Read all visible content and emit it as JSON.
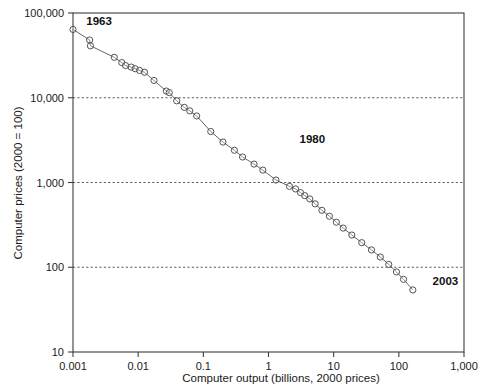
{
  "chart_data": {
    "type": "scatter",
    "title": "",
    "xlabel": "Computer output (billions, 2000 prices)",
    "ylabel": "Computer prices (2000 = 100)",
    "xscale": "log",
    "yscale": "log",
    "xlim": [
      0.001,
      1000
    ],
    "ylim": [
      10,
      100000
    ],
    "grid": "horizontal dashed gridlines at y = 10,000 / 1,000 / 100",
    "legend": "none",
    "marker": "open circle",
    "line": "solid thin connecting line",
    "xticks": [
      0.001,
      0.01,
      0.1,
      1,
      10,
      100,
      1000
    ],
    "xtick_labels": [
      "0.001",
      "0.01",
      "0.1",
      "1",
      "10",
      "100",
      "1,000"
    ],
    "yticks": [
      10,
      100,
      1000,
      10000,
      100000
    ],
    "ytick_labels": [
      "10",
      "100",
      "1,000",
      "10,000",
      "100,000"
    ],
    "gridline_values": [
      10000,
      1000,
      100
    ],
    "annotations": [
      {
        "text": "1963",
        "x": 0.0016,
        "y": 72000,
        "anchor": "start"
      },
      {
        "text": "1980",
        "x": 3.0,
        "y": 2900,
        "anchor": "start"
      },
      {
        "text": "2003",
        "x": 330,
        "y": 62,
        "anchor": "start"
      }
    ],
    "series": [
      {
        "name": "Computer prices vs computer output, 1963-2003",
        "x": [
          0.001,
          0.0018,
          0.00185,
          0.0043,
          0.0056,
          0.0064,
          0.0078,
          0.009,
          0.0105,
          0.0125,
          0.0175,
          0.027,
          0.03,
          0.039,
          0.051,
          0.062,
          0.079,
          0.13,
          0.2,
          0.3,
          0.4,
          0.6,
          0.82,
          1.3,
          2.1,
          2.6,
          3.1,
          3.6,
          4.3,
          5.2,
          6.6,
          8.6,
          11.0,
          14.0,
          19.0,
          27.0,
          38.0,
          52.0,
          70.0,
          92.0,
          118.0,
          164.0
        ],
        "y": [
          64000,
          48000,
          41000,
          30000,
          26000,
          24000,
          23000,
          22000,
          21000,
          20000,
          16000,
          12000,
          11500,
          9200,
          7700,
          7000,
          6100,
          4000,
          3000,
          2400,
          2000,
          1650,
          1400,
          1070,
          900,
          840,
          760,
          700,
          640,
          560,
          470,
          400,
          340,
          290,
          240,
          195,
          160,
          132,
          108,
          88,
          72,
          54
        ]
      }
    ]
  },
  "axes": {
    "y_title": "Computer prices (2000 = 100)",
    "x_title": "Computer output (billions, 2000 prices)"
  }
}
